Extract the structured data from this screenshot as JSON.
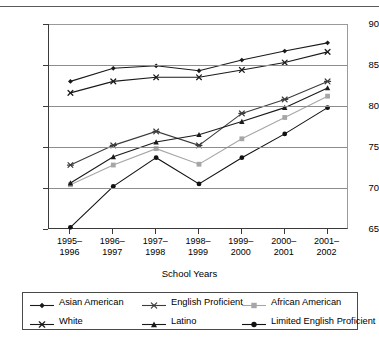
{
  "chart_data": {
    "type": "line",
    "title": "",
    "xlabel": "School Years",
    "ylabel": "",
    "ylim": [
      65,
      90
    ],
    "yticks": [
      65,
      70,
      75,
      80,
      85,
      90
    ],
    "grid": true,
    "legend_position": "bottom",
    "categories": [
      "1995–\n1996",
      "1996–\n1997",
      "1997–\n1998",
      "1998–\n1999",
      "1999–\n2000",
      "2000–\n2001",
      "2001–\n2002"
    ],
    "category_lines": [
      [
        "1995–",
        "1996"
      ],
      [
        "1996–",
        "1997"
      ],
      [
        "1997–",
        "1998"
      ],
      [
        "1998–",
        "1999"
      ],
      [
        "1999–",
        "2000"
      ],
      [
        "2000–",
        "2001"
      ],
      [
        "2001–",
        "2002"
      ]
    ],
    "series": [
      {
        "name": "Asian American",
        "marker": "diamond",
        "color": "#1a1a1a",
        "values": [
          83.0,
          84.6,
          84.9,
          84.3,
          85.6,
          86.7,
          87.7
        ]
      },
      {
        "name": "English Proficient",
        "marker": "asterisk",
        "color": "#3c3c3c",
        "values": [
          72.8,
          75.2,
          76.9,
          75.2,
          79.1,
          80.8,
          83.0
        ]
      },
      {
        "name": "African American",
        "marker": "square",
        "color": "#a6a6a6",
        "values": [
          70.4,
          72.8,
          74.8,
          72.9,
          76.0,
          78.6,
          81.2
        ]
      },
      {
        "name": "White",
        "marker": "x",
        "color": "#1a1a1a",
        "values": [
          81.6,
          83.0,
          83.5,
          83.5,
          84.4,
          85.3,
          86.6
        ]
      },
      {
        "name": "Latino",
        "marker": "triangle",
        "color": "#1a1a1a",
        "values": [
          70.6,
          73.8,
          75.6,
          76.5,
          78.1,
          79.8,
          82.2
        ]
      },
      {
        "name": "Limited English Proficient",
        "marker": "circle",
        "color": "#111111",
        "values": [
          65.2,
          70.2,
          73.7,
          70.5,
          73.7,
          76.6,
          79.8
        ]
      }
    ]
  },
  "axis": {
    "x_title": "School Years",
    "y_tick_labels": [
      "90",
      "85",
      "80",
      "75",
      "70",
      "65"
    ]
  },
  "legend": {
    "items": [
      {
        "label": "Asian American",
        "marker": "diamond",
        "color": "#1a1a1a"
      },
      {
        "label": "English Proficient",
        "marker": "asterisk",
        "color": "#3c3c3c"
      },
      {
        "label": "African American",
        "marker": "square",
        "color": "#a6a6a6"
      },
      {
        "label": "White",
        "marker": "x",
        "color": "#1a1a1a"
      },
      {
        "label": "Latino",
        "marker": "triangle",
        "color": "#1a1a1a"
      },
      {
        "label": "Limited English Proficient",
        "marker": "circle",
        "color": "#111111"
      }
    ]
  }
}
